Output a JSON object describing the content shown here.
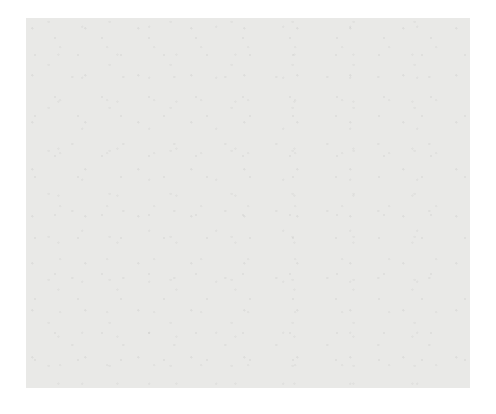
{
  "figure": {
    "type": "bayesian-network",
    "title": "",
    "background_color": "#e9e9e7",
    "node_fill_color": "#f4f4f2",
    "variable_fill_color": "#b9b9b7",
    "edge_color": "#55555a",
    "glyph_fill_color": "#2b2b2b"
  },
  "nodes": [
    {
      "id": "Age",
      "label": "Age",
      "kind": "variable",
      "x": 104,
      "y": 33,
      "w": 31,
      "h": 14,
      "glyph": {
        "x": 112,
        "y": 46,
        "fill": 100
      }
    },
    {
      "id": "Edu",
      "label": "Edu",
      "kind": "variable",
      "x": 155,
      "y": 32,
      "w": 27,
      "h": 14,
      "glyph": null
    },
    {
      "id": "Social",
      "label": "Social",
      "kind": "variable",
      "x": 185,
      "y": 32,
      "w": 38,
      "h": 14,
      "glyph": null
    },
    {
      "id": "MMSE",
      "label": "MMSE",
      "kind": "variable",
      "x": 240,
      "y": 32,
      "w": 35,
      "h": 14,
      "glyph": null
    },
    {
      "id": "Expre_abl",
      "label": "Expre_abl",
      "kind": "variable",
      "x": 277,
      "y": 32,
      "w": 51,
      "h": 14,
      "glyph": null
    },
    {
      "id": "InDep",
      "label": "InDep",
      "kind": "variable",
      "x": 345,
      "y": 33,
      "w": 33,
      "h": 14,
      "glyph": {
        "x": 352,
        "y": 46,
        "fill": 100
      }
    },
    {
      "id": "Mem_abl",
      "label": "Mem_abl",
      "kind": "variable",
      "x": 412,
      "y": 33,
      "w": 47,
      "h": 14,
      "glyph": null
    },
    {
      "id": "M-Lang",
      "label": "M-Lang",
      "kind": "variable",
      "x": 30,
      "y": 76,
      "w": 42,
      "h": 14,
      "glyph": null
    },
    {
      "id": "pnt29",
      "label": "pnt29",
      "kind": "point",
      "x": 96,
      "y": 63,
      "w": 31,
      "h": 13,
      "glyph": {
        "x": 106,
        "y": 50,
        "fill": 100
      }
    },
    {
      "id": "pnt16",
      "label": "pnt16",
      "kind": "point",
      "x": 345,
      "y": 63,
      "w": 31,
      "h": 13,
      "glyph": {
        "x": 354,
        "y": 50,
        "fill": 100
      }
    },
    {
      "id": "pnt7",
      "label": "pnt7",
      "kind": "point",
      "x": 152,
      "y": 115,
      "w": 28,
      "h": 13,
      "glyph": {
        "x": 158,
        "y": 102,
        "fill": 55
      }
    },
    {
      "id": "pnt33",
      "label": "pnt33",
      "kind": "point",
      "x": 234,
      "y": 115,
      "w": 31,
      "h": 13,
      "glyph": {
        "x": 243,
        "y": 102,
        "fill": 55
      }
    },
    {
      "id": "pnt1",
      "label": "pnt1",
      "kind": "point",
      "x": 300,
      "y": 114,
      "w": 28,
      "h": 13,
      "glyph": {
        "x": 306,
        "y": 101,
        "fill": 50
      }
    },
    {
      "id": "pnt19",
      "label": "pnt19",
      "kind": "point",
      "x": 38,
      "y": 160,
      "w": 31,
      "h": 13,
      "glyph": {
        "x": 48,
        "y": 147,
        "fill": 50
      }
    },
    {
      "id": "pnt21",
      "label": "pnt21",
      "kind": "point",
      "x": 226,
      "y": 160,
      "w": 31,
      "h": 13,
      "glyph": {
        "x": 235,
        "y": 147,
        "fill": 55
      }
    },
    {
      "id": "pnt14",
      "label": "pnt14",
      "kind": "point",
      "x": 277,
      "y": 160,
      "w": 31,
      "h": 13,
      "glyph": {
        "x": 286,
        "y": 147,
        "fill": 55
      }
    },
    {
      "id": "pnt",
      "label": "pnt",
      "kind": "point",
      "x": 344,
      "y": 160,
      "w": 23,
      "h": 13,
      "glyph": {
        "x": 349,
        "y": 147,
        "fill": 55
      }
    },
    {
      "id": "pnt20",
      "label": "pnt20",
      "kind": "point",
      "x": 362,
      "y": 160,
      "w": 31,
      "h": 13,
      "glyph": {
        "x": 371,
        "y": 147,
        "fill": 55
      }
    },
    {
      "id": "pnt12",
      "label": "pnt12",
      "kind": "point",
      "x": 403,
      "y": 160,
      "w": 31,
      "h": 13,
      "glyph": {
        "x": 412,
        "y": 147,
        "fill": 50
      }
    },
    {
      "id": "pnt15",
      "label": "pnt15",
      "kind": "point",
      "x": 140,
      "y": 212,
      "w": 31,
      "h": 13,
      "glyph": {
        "x": 149,
        "y": 199,
        "fill": 55
      }
    },
    {
      "id": "pnt6",
      "label": "pnt6",
      "kind": "point",
      "x": 222,
      "y": 209,
      "w": 26,
      "h": 13,
      "glyph": {
        "x": 228,
        "y": 196,
        "fill": 55
      }
    },
    {
      "id": "pnt17",
      "label": "pnt17",
      "kind": "point",
      "x": 48,
      "y": 264,
      "w": 31,
      "h": 13,
      "glyph": {
        "x": 57,
        "y": 251,
        "fill": 55
      }
    },
    {
      "id": "pnt25",
      "label": "pnt25",
      "kind": "point",
      "x": 80,
      "y": 264,
      "w": 31,
      "h": 13,
      "glyph": {
        "x": 89,
        "y": 251,
        "fill": 55
      }
    },
    {
      "id": "pnt5",
      "label": "pnt5",
      "kind": "point",
      "x": 188,
      "y": 264,
      "w": 26,
      "h": 13,
      "glyph": {
        "x": 194,
        "y": 251,
        "fill": 55
      }
    },
    {
      "id": "pnt2b",
      "label": "nt2",
      "kind": "point",
      "x": 212,
      "y": 264,
      "w": 22,
      "h": 13,
      "glyph": {
        "x": 216,
        "y": 251,
        "fill": 55
      }
    },
    {
      "id": "pnt23",
      "label": "pnt23",
      "kind": "point",
      "x": 232,
      "y": 264,
      "w": 31,
      "h": 13,
      "glyph": {
        "x": 241,
        "y": 251,
        "fill": 55
      }
    },
    {
      "id": "pnt8",
      "label": "pnt8",
      "kind": "point",
      "x": 53,
      "y": 313,
      "w": 27,
      "h": 13,
      "glyph": {
        "x": 59,
        "y": 300,
        "fill": 55
      }
    },
    {
      "id": "pnt22",
      "label": "pnt22",
      "kind": "point",
      "x": 98,
      "y": 310,
      "w": 31,
      "h": 13,
      "glyph": {
        "x": 107,
        "y": 297,
        "fill": 55
      }
    },
    {
      "id": "pnt32",
      "label": "pnt32",
      "kind": "point",
      "x": 142,
      "y": 310,
      "w": 31,
      "h": 13,
      "glyph": {
        "x": 151,
        "y": 297,
        "fill": 55
      }
    },
    {
      "id": "pnt24",
      "label": "nt24",
      "kind": "point",
      "x": 166,
      "y": 313,
      "w": 26,
      "h": 13,
      "glyph": {
        "x": 170,
        "y": 300,
        "fill": 55
      }
    },
    {
      "id": "pnt2",
      "label": "pnt2",
      "kind": "point",
      "x": 238,
      "y": 313,
      "w": 27,
      "h": 13,
      "glyph": {
        "x": 244,
        "y": 300,
        "fill": 55
      }
    },
    {
      "id": "pnt13",
      "label": "pnt13",
      "kind": "point",
      "x": 284,
      "y": 313,
      "w": 31,
      "h": 13,
      "glyph": {
        "x": 293,
        "y": 300,
        "fill": 55
      }
    },
    {
      "id": "pnt3",
      "label": "pnt3",
      "kind": "point",
      "x": 313,
      "y": 310,
      "w": 27,
      "h": 13,
      "glyph": {
        "x": 327,
        "y": 298,
        "fill": 55
      }
    },
    {
      "id": "pnt18",
      "label": "pnt18",
      "kind": "point",
      "x": 346,
      "y": 313,
      "w": 33,
      "h": 13,
      "glyph": {
        "x": 355,
        "y": 299,
        "fill": 45
      }
    },
    {
      "id": "pnt27",
      "label": "pnt27",
      "kind": "point",
      "x": 196,
      "y": 362,
      "w": 31,
      "h": 13,
      "glyph": {
        "x": 205,
        "y": 349,
        "fill": 55
      }
    }
  ],
  "edge_endpoints": [
    {
      "id": "h1",
      "x": 118,
      "y": 56
    },
    {
      "id": "h2",
      "x": 358,
      "y": 56
    },
    {
      "id": "h3",
      "x": 52,
      "y": 90
    },
    {
      "id": "h4",
      "x": 170,
      "y": 46
    },
    {
      "id": "h5",
      "x": 204,
      "y": 46
    },
    {
      "id": "h6",
      "x": 257,
      "y": 46
    },
    {
      "id": "h7",
      "x": 302,
      "y": 46
    },
    {
      "id": "h8",
      "x": 435,
      "y": 47
    }
  ],
  "counts": {
    "variables": 8,
    "points": 27
  }
}
